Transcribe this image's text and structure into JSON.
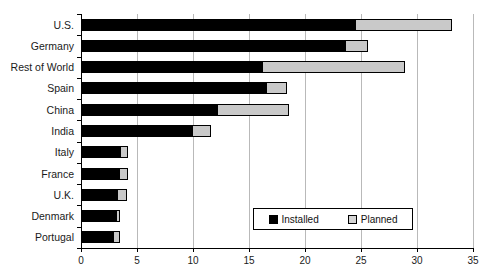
{
  "chart_data": {
    "type": "bar",
    "orientation": "horizontal",
    "stacked": true,
    "title": "",
    "xlabel": "",
    "ylabel": "",
    "xlim": [
      0,
      35
    ],
    "xticks": [
      0,
      5,
      10,
      15,
      20,
      25,
      30,
      35
    ],
    "grid": true,
    "legend_position": "inside-lower-right",
    "categories": [
      "U.S.",
      "Germany",
      "Rest of World",
      "Spain",
      "China",
      "India",
      "Italy",
      "France",
      "U.K.",
      "Denmark",
      "Portugal"
    ],
    "series": [
      {
        "name": "Installed",
        "color": "#000000",
        "values": [
          24.5,
          23.6,
          16.2,
          16.5,
          12.1,
          9.9,
          3.5,
          3.4,
          3.2,
          3.1,
          2.9
        ]
      },
      {
        "name": "Planned",
        "color": "#c9c9c9",
        "values": [
          8.5,
          1.9,
          12.6,
          1.8,
          6.4,
          1.6,
          0.6,
          0.7,
          0.8,
          0.3,
          0.5
        ]
      }
    ],
    "totals": [
      33.0,
      25.5,
      28.8,
      18.3,
      18.5,
      11.5,
      4.1,
      4.1,
      4.0,
      3.4,
      3.4
    ]
  },
  "legend": {
    "items": [
      {
        "label": "Installed",
        "swatch": "installed"
      },
      {
        "label": "Planned",
        "swatch": "planned"
      }
    ]
  }
}
